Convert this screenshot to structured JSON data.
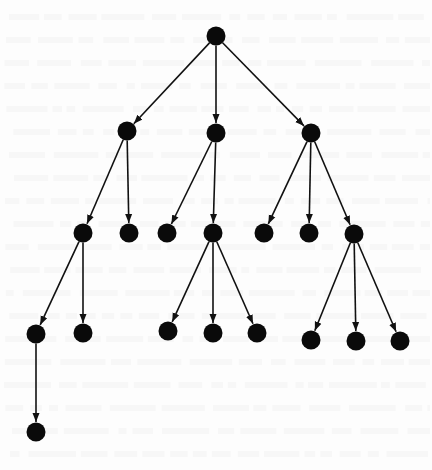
{
  "diagram": {
    "type": "rooted-tree",
    "style": {
      "node_color": "#0a0a0a",
      "edge_color": "#111111",
      "background": "#fdfdfd",
      "node_radius": 9.5
    },
    "nodes": [
      {
        "id": "root",
        "x": 216,
        "y": 36
      },
      {
        "id": "a",
        "x": 127,
        "y": 131
      },
      {
        "id": "b",
        "x": 216,
        "y": 133
      },
      {
        "id": "c",
        "x": 311,
        "y": 133
      },
      {
        "id": "a1",
        "x": 83,
        "y": 233
      },
      {
        "id": "a2",
        "x": 129,
        "y": 233
      },
      {
        "id": "b1",
        "x": 167,
        "y": 233
      },
      {
        "id": "b2",
        "x": 213,
        "y": 233
      },
      {
        "id": "c1",
        "x": 264,
        "y": 233
      },
      {
        "id": "c2",
        "x": 309,
        "y": 233
      },
      {
        "id": "c3",
        "x": 354,
        "y": 234
      },
      {
        "id": "a1a",
        "x": 36,
        "y": 334
      },
      {
        "id": "a1b",
        "x": 83,
        "y": 333
      },
      {
        "id": "b2a",
        "x": 168,
        "y": 331
      },
      {
        "id": "b2b",
        "x": 213,
        "y": 333
      },
      {
        "id": "b2c",
        "x": 257,
        "y": 333
      },
      {
        "id": "c3a",
        "x": 311,
        "y": 340
      },
      {
        "id": "c3b",
        "x": 356,
        "y": 341
      },
      {
        "id": "c3c",
        "x": 400,
        "y": 341
      },
      {
        "id": "a1a1",
        "x": 36,
        "y": 432
      }
    ],
    "edges": [
      [
        "root",
        "a"
      ],
      [
        "root",
        "b"
      ],
      [
        "root",
        "c"
      ],
      [
        "a",
        "a1"
      ],
      [
        "a",
        "a2"
      ],
      [
        "b",
        "b1"
      ],
      [
        "b",
        "b2"
      ],
      [
        "c",
        "c1"
      ],
      [
        "c",
        "c2"
      ],
      [
        "c",
        "c3"
      ],
      [
        "a1",
        "a1a"
      ],
      [
        "a1",
        "a1b"
      ],
      [
        "b2",
        "b2a"
      ],
      [
        "b2",
        "b2b"
      ],
      [
        "b2",
        "b2c"
      ],
      [
        "c3",
        "c3a"
      ],
      [
        "c3",
        "c3b"
      ],
      [
        "c3",
        "c3c"
      ],
      [
        "a1a",
        "a1a1"
      ]
    ]
  }
}
